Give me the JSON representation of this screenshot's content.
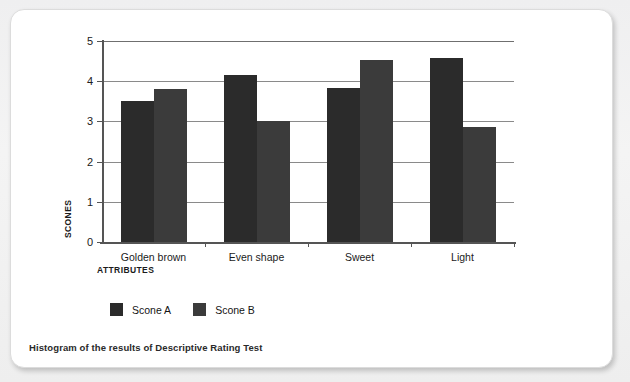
{
  "caption": "Histogram of the results of Descriptive Rating Test",
  "legend": {
    "items": [
      {
        "label": "Scone A",
        "color": "#2b2b2b"
      },
      {
        "label": "Scone B",
        "color": "#3b3b3b"
      }
    ]
  },
  "axes": {
    "y_title": "SCONES",
    "x_title": "ATTRIBUTES"
  },
  "chart_data": {
    "type": "bar",
    "title": "Histogram of the results of Descriptive Rating Test",
    "xlabel": "ATTRIBUTES",
    "ylabel": "SCONES",
    "categories": [
      "Golden brown",
      "Even shape",
      "Sweet",
      "Light"
    ],
    "series": [
      {
        "name": "Scone A",
        "color": "#2b2b2b",
        "values": [
          3.5,
          4.15,
          3.83,
          4.57
        ]
      },
      {
        "name": "Scone B",
        "color": "#3b3b3b",
        "values": [
          3.8,
          3.02,
          4.52,
          2.85
        ]
      }
    ],
    "ylim": [
      0,
      5
    ],
    "yticks": [
      0,
      1,
      2,
      3,
      4,
      5
    ],
    "ytick_labels": [
      "0",
      "1",
      "2",
      "3",
      "4",
      "5"
    ],
    "grid": true,
    "legend_position": "bottom-left"
  }
}
